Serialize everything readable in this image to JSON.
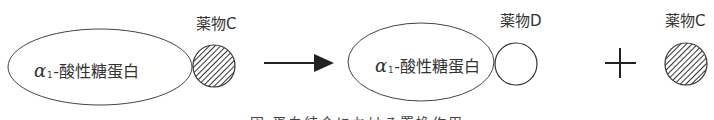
{
  "diagram": {
    "left": {
      "protein": {
        "greek": "α",
        "subscript": "1",
        "text": "-酸性糖蛋白"
      },
      "drug": {
        "label": "薬物C",
        "fill": "hatched"
      }
    },
    "arrow": {
      "direction": "right"
    },
    "right": {
      "protein": {
        "greek": "α",
        "subscript": "1",
        "text": "-酸性糖蛋白"
      },
      "bound_drug": {
        "label": "薬物D",
        "fill": "empty"
      },
      "plus": "+",
      "free_drug": {
        "label": "薬物C",
        "fill": "hatched"
      }
    },
    "caption": "図 蛋白結合における置換作用"
  },
  "colors": {
    "stroke": "#333333",
    "background": "#ffffff"
  }
}
